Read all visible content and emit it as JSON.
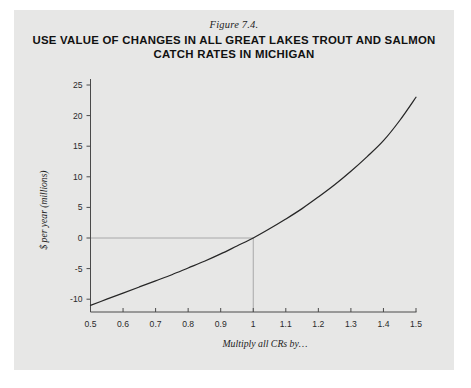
{
  "figure": {
    "number_label": "Figure 7.4.",
    "title": "USE VALUE OF CHANGES IN ALL GREAT LAKES TROUT AND SALMON CATCH RATES IN MICHIGAN",
    "plate_color": "#e7e7e6",
    "page_color": "#ffffff"
  },
  "chart_data": {
    "type": "line",
    "title": "USE VALUE OF CHANGES IN ALL GREAT LAKES TROUT AND SALMON CATCH RATES IN MICHIGAN",
    "subtitle": "Figure 7.4.",
    "xlabel": "Multiply all CRs by…",
    "ylabel": "$ per year (millions)",
    "xlim": [
      0.5,
      1.5
    ],
    "ylim": [
      -12.5,
      26.5
    ],
    "xticks": [
      0.5,
      0.6,
      0.7,
      0.8,
      0.9,
      1,
      1.1,
      1.2,
      1.3,
      1.4,
      1.5
    ],
    "xtick_labels": [
      "0.5",
      "0.6",
      "0.7",
      "0.8",
      "0.9",
      "1",
      "1.1",
      "1.2",
      "1.3",
      "1.4",
      "1.5"
    ],
    "yticks": [
      -10,
      -5,
      0,
      5,
      10,
      15,
      20,
      25
    ],
    "ytick_labels": [
      "-10",
      "-5",
      "0",
      "5",
      "10",
      "15",
      "20",
      "25"
    ],
    "grid": false,
    "legend": "none",
    "line_color": "#262626",
    "reference_line_color": "#9a9a9a",
    "series": [
      {
        "name": "Use value of catch-rate change",
        "x": [
          0.5,
          0.55,
          0.6,
          0.65,
          0.7,
          0.75,
          0.8,
          0.85,
          0.9,
          0.95,
          1.0,
          1.05,
          1.1,
          1.15,
          1.2,
          1.25,
          1.3,
          1.35,
          1.4,
          1.45,
          1.5
        ],
        "y": [
          -11.0,
          -10.0,
          -9.0,
          -8.0,
          -7.0,
          -6.0,
          -4.9,
          -3.8,
          -2.6,
          -1.3,
          0.0,
          1.5,
          3.1,
          4.8,
          6.7,
          8.7,
          10.9,
          13.3,
          15.9,
          19.2,
          23.0
        ]
      }
    ],
    "annotations": [
      {
        "name": "reference-crosshair",
        "description": "Light grey guide lines marking the point (1, 0) where the curve crosses zero",
        "x": 1,
        "y": 0
      }
    ]
  }
}
